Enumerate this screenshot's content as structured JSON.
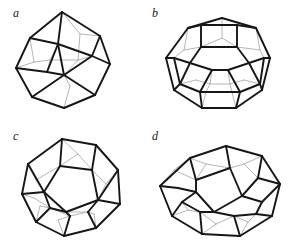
{
  "figure": {
    "background_color": "#ffffff",
    "width": 289,
    "height": 249,
    "caption_style": "italic-serif-lowercase",
    "front_edge_color": "#161616",
    "back_edge_color": "#a9a9a9",
    "front_edge_width": 1.9,
    "back_edge_width": 0.85
  },
  "panels": [
    {
      "id": "a",
      "label": "a",
      "name": "rhombic-dodecahedron",
      "description": "Wireframe zonohedron with rhombic faces, viewed near a 3-fold axis",
      "faces_visible": "rhombi",
      "front_edges": [
        [
          62,
          12,
          30,
          38
        ],
        [
          30,
          38,
          16,
          68
        ],
        [
          16,
          68,
          32,
          97
        ],
        [
          32,
          97,
          64,
          108
        ],
        [
          64,
          108,
          95,
          95
        ],
        [
          95,
          95,
          110,
          64
        ],
        [
          110,
          64,
          100,
          36
        ],
        [
          100,
          36,
          62,
          12
        ],
        [
          62,
          12,
          58,
          44
        ],
        [
          58,
          44,
          30,
          38
        ],
        [
          58,
          44,
          64,
          75
        ],
        [
          64,
          75,
          32,
          97
        ],
        [
          64,
          75,
          95,
          95
        ],
        [
          64,
          75,
          92,
          56
        ],
        [
          92,
          56,
          110,
          64
        ],
        [
          92,
          56,
          100,
          36
        ],
        [
          58,
          44,
          92,
          56
        ],
        [
          16,
          68,
          47,
          72
        ],
        [
          47,
          72,
          64,
          75
        ],
        [
          47,
          72,
          58,
          44
        ]
      ],
      "back_edges": [
        [
          62,
          12,
          80,
          34
        ],
        [
          80,
          34,
          100,
          36
        ],
        [
          80,
          34,
          78,
          60
        ],
        [
          78,
          60,
          92,
          56
        ],
        [
          78,
          60,
          64,
          75
        ],
        [
          78,
          60,
          50,
          60
        ],
        [
          50,
          60,
          58,
          44
        ],
        [
          50,
          60,
          47,
          72
        ],
        [
          16,
          68,
          34,
          62
        ],
        [
          34,
          62,
          50,
          60
        ],
        [
          34,
          62,
          30,
          38
        ],
        [
          64,
          108,
          70,
          86
        ],
        [
          70,
          86,
          64,
          75
        ]
      ]
    },
    {
      "id": "b",
      "label": "b",
      "name": "truncated-octahedron",
      "description": "Wireframe truncated octahedron with square and hexagonal faces, square face forward at top",
      "faces_visible": "squares and hexagons",
      "front_edges": [
        [
          44,
          28,
          78,
          18
        ],
        [
          78,
          18,
          112,
          28
        ],
        [
          112,
          28,
          126,
          58
        ],
        [
          126,
          58,
          118,
          90
        ],
        [
          118,
          90,
          92,
          108
        ],
        [
          92,
          108,
          58,
          108
        ],
        [
          58,
          108,
          30,
          90
        ],
        [
          30,
          90,
          22,
          58
        ],
        [
          22,
          58,
          44,
          28
        ],
        [
          57,
          25,
          93,
          25
        ],
        [
          93,
          25,
          93,
          47
        ],
        [
          93,
          47,
          57,
          47
        ],
        [
          57,
          47,
          57,
          25
        ],
        [
          57,
          25,
          44,
          28
        ],
        [
          93,
          25,
          112,
          28
        ],
        [
          57,
          47,
          46,
          63
        ],
        [
          93,
          47,
          105,
          63
        ],
        [
          46,
          63,
          36,
          84
        ],
        [
          105,
          63,
          116,
          84
        ],
        [
          46,
          63,
          30,
          58
        ],
        [
          105,
          63,
          120,
          58
        ],
        [
          30,
          58,
          22,
          58
        ],
        [
          120,
          58,
          126,
          58
        ],
        [
          30,
          58,
          36,
          84
        ],
        [
          120,
          58,
          116,
          84
        ],
        [
          36,
          84,
          30,
          90
        ],
        [
          116,
          84,
          118,
          90
        ],
        [
          36,
          84,
          56,
          92
        ],
        [
          116,
          84,
          96,
          92
        ],
        [
          56,
          92,
          96,
          92
        ],
        [
          56,
          92,
          58,
          108
        ],
        [
          96,
          92,
          92,
          108
        ],
        [
          46,
          63,
          68,
          70
        ],
        [
          105,
          63,
          84,
          70
        ],
        [
          68,
          70,
          84,
          70
        ],
        [
          68,
          70,
          56,
          92
        ],
        [
          84,
          70,
          96,
          92
        ]
      ],
      "back_edges": [
        [
          78,
          18,
          78,
          38
        ],
        [
          78,
          38,
          57,
          47
        ],
        [
          78,
          38,
          93,
          47
        ],
        [
          44,
          28,
          40,
          50
        ],
        [
          40,
          50,
          57,
          47
        ],
        [
          40,
          50,
          30,
          58
        ],
        [
          112,
          28,
          116,
          50
        ],
        [
          116,
          50,
          93,
          47
        ],
        [
          116,
          50,
          120,
          58
        ],
        [
          58,
          108,
          62,
          92
        ],
        [
          92,
          108,
          88,
          92
        ],
        [
          62,
          92,
          88,
          92
        ],
        [
          62,
          92,
          56,
          92
        ],
        [
          88,
          92,
          96,
          92
        ],
        [
          68,
          70,
          66,
          84
        ],
        [
          84,
          70,
          86,
          84
        ],
        [
          66,
          84,
          86,
          84
        ],
        [
          66,
          84,
          62,
          92
        ],
        [
          86,
          84,
          88,
          92
        ],
        [
          36,
          84,
          52,
          80
        ],
        [
          52,
          80,
          66,
          84
        ],
        [
          116,
          84,
          100,
          80
        ],
        [
          100,
          80,
          86,
          84
        ]
      ]
    },
    {
      "id": "c",
      "label": "c",
      "name": "regular-dodecahedron",
      "description": "Wireframe regular dodecahedron with twelve pentagonal faces, one pentagon facing the viewer",
      "faces_visible": "pentagons",
      "front_edges": [
        [
          62,
          15,
          96,
          21
        ],
        [
          96,
          21,
          118,
          46
        ],
        [
          118,
          46,
          120,
          80
        ],
        [
          120,
          80,
          96,
          104
        ],
        [
          96,
          104,
          64,
          112
        ],
        [
          64,
          112,
          36,
          98
        ],
        [
          36,
          98,
          22,
          70
        ],
        [
          22,
          70,
          28,
          40
        ],
        [
          28,
          40,
          62,
          15
        ],
        [
          62,
          15,
          60,
          42
        ],
        [
          96,
          21,
          92,
          46
        ],
        [
          60,
          42,
          92,
          46
        ],
        [
          92,
          46,
          98,
          76
        ],
        [
          98,
          76,
          66,
          88
        ],
        [
          66,
          88,
          44,
          68
        ],
        [
          44,
          68,
          60,
          42
        ],
        [
          28,
          40,
          44,
          68
        ],
        [
          22,
          70,
          44,
          68
        ],
        [
          118,
          46,
          98,
          76
        ],
        [
          120,
          80,
          98,
          76
        ],
        [
          36,
          98,
          50,
          84
        ],
        [
          50,
          84,
          66,
          88
        ],
        [
          64,
          112,
          70,
          92
        ],
        [
          70,
          92,
          66,
          88
        ],
        [
          96,
          104,
          88,
          88
        ],
        [
          88,
          88,
          98,
          76
        ],
        [
          50,
          84,
          44,
          68
        ]
      ],
      "back_edges": [
        [
          62,
          15,
          78,
          30
        ],
        [
          78,
          30,
          92,
          46
        ],
        [
          78,
          30,
          60,
          42
        ],
        [
          28,
          40,
          36,
          56
        ],
        [
          36,
          56,
          44,
          68
        ],
        [
          36,
          56,
          60,
          42
        ],
        [
          118,
          46,
          106,
          60
        ],
        [
          106,
          60,
          98,
          76
        ],
        [
          106,
          60,
          92,
          46
        ],
        [
          50,
          84,
          70,
          92
        ],
        [
          70,
          92,
          88,
          88
        ],
        [
          88,
          88,
          66,
          88
        ],
        [
          36,
          98,
          40,
          82
        ],
        [
          40,
          82,
          50,
          84
        ],
        [
          64,
          112,
          58,
          96
        ],
        [
          58,
          96,
          70,
          92
        ],
        [
          96,
          104,
          94,
          90
        ],
        [
          94,
          90,
          88,
          88
        ],
        [
          22,
          70,
          34,
          74
        ],
        [
          34,
          74,
          50,
          84
        ]
      ]
    },
    {
      "id": "d",
      "label": "d",
      "name": "elongated-dodecahedron",
      "description": "Wireframe elongated dodecahedron (rhombo-hexagonal dodecahedron) seen from an oblique angle",
      "faces_visible": "pentagons and hexagons",
      "front_edges": [
        [
          46,
          34,
          82,
          22
        ],
        [
          82,
          22,
          118,
          32
        ],
        [
          118,
          32,
          136,
          60
        ],
        [
          136,
          60,
          128,
          92
        ],
        [
          128,
          92,
          96,
          112
        ],
        [
          96,
          112,
          58,
          110
        ],
        [
          58,
          110,
          28,
          92
        ],
        [
          28,
          92,
          16,
          62
        ],
        [
          16,
          62,
          46,
          34
        ],
        [
          46,
          34,
          52,
          56
        ],
        [
          82,
          22,
          86,
          44
        ],
        [
          52,
          56,
          86,
          44
        ],
        [
          86,
          44,
          98,
          72
        ],
        [
          98,
          72,
          70,
          88
        ],
        [
          70,
          88,
          52,
          68
        ],
        [
          52,
          68,
          52,
          56
        ],
        [
          16,
          62,
          34,
          64
        ],
        [
          34,
          64,
          52,
          68
        ],
        [
          118,
          32,
          114,
          54
        ],
        [
          114,
          54,
          98,
          72
        ],
        [
          136,
          60,
          118,
          78
        ],
        [
          118,
          78,
          98,
          72
        ],
        [
          114,
          54,
          136,
          60
        ],
        [
          128,
          92,
          112,
          90
        ],
        [
          112,
          90,
          118,
          78
        ],
        [
          96,
          112,
          90,
          92
        ],
        [
          90,
          92,
          70,
          88
        ],
        [
          112,
          90,
          90,
          92
        ],
        [
          58,
          110,
          56,
          88
        ],
        [
          56,
          88,
          70,
          88
        ],
        [
          28,
          92,
          38,
          78
        ],
        [
          38,
          78,
          52,
          68
        ],
        [
          38,
          78,
          56,
          88
        ]
      ],
      "back_edges": [
        [
          46,
          34,
          62,
          40
        ],
        [
          62,
          40,
          86,
          44
        ],
        [
          62,
          40,
          52,
          56
        ],
        [
          16,
          62,
          30,
          46
        ],
        [
          30,
          46,
          46,
          34
        ],
        [
          30,
          46,
          52,
          56
        ],
        [
          118,
          32,
          100,
          40
        ],
        [
          100,
          40,
          86,
          44
        ],
        [
          100,
          40,
          114,
          54
        ],
        [
          58,
          110,
          72,
          100
        ],
        [
          72,
          100,
          90,
          92
        ],
        [
          72,
          100,
          56,
          88
        ],
        [
          28,
          92,
          44,
          86
        ],
        [
          44,
          86,
          56,
          88
        ],
        [
          44,
          86,
          38,
          78
        ],
        [
          96,
          112,
          104,
          98
        ],
        [
          104,
          98,
          112,
          90
        ],
        [
          104,
          98,
          90,
          92
        ],
        [
          34,
          64,
          44,
          66
        ],
        [
          44,
          66,
          52,
          68
        ]
      ]
    }
  ]
}
